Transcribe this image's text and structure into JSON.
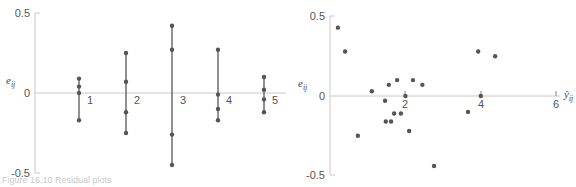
{
  "caption": "Figure 16.10 Residual plots",
  "chart_data": [
    {
      "type": "scatter",
      "title": "",
      "xlabel": "",
      "ylabel": "e_ij",
      "ylim": [
        -0.5,
        0.5
      ],
      "yticks": [
        "0.5",
        "0",
        "-0.5"
      ],
      "grid": false,
      "legend": null,
      "categories": [
        "1",
        "2",
        "3",
        "4",
        "5"
      ],
      "series": [
        {
          "name": "1",
          "values": [
            0.09,
            0.04,
            0.0,
            -0.17
          ]
        },
        {
          "name": "2",
          "values": [
            0.25,
            0.07,
            -0.12,
            -0.25
          ]
        },
        {
          "name": "3",
          "values": [
            0.42,
            0.27,
            -0.26,
            -0.45
          ]
        },
        {
          "name": "4",
          "values": [
            0.27,
            -0.01,
            -0.1,
            -0.17
          ]
        },
        {
          "name": "5",
          "values": [
            0.1,
            0.02,
            -0.04,
            -0.12
          ]
        }
      ],
      "annotations": [
        "vertical lines connect residuals within each group"
      ]
    },
    {
      "type": "scatter",
      "title": "",
      "xlabel": "ŷ_ij",
      "ylabel": "e_ij",
      "xlim": [
        0,
        6.5
      ],
      "ylim": [
        -0.5,
        0.5
      ],
      "xticks": [
        "2",
        "4",
        "6"
      ],
      "yticks": [
        "0.5",
        "0",
        "-0.5"
      ],
      "grid": false,
      "legend": null,
      "x": [
        0.21,
        0.4,
        0.74,
        1.11,
        1.46,
        1.56,
        1.48,
        1.62,
        1.7,
        1.78,
        1.88,
        2.0,
        2.1,
        2.2,
        2.45,
        2.76,
        3.66,
        3.93,
        4.0,
        4.38
      ],
      "y": [
        0.43,
        0.28,
        -0.25,
        0.03,
        -0.03,
        0.07,
        -0.16,
        -0.16,
        -0.11,
        0.1,
        -0.11,
        0.0,
        -0.22,
        0.1,
        0.07,
        -0.44,
        -0.1,
        0.28,
        0.0,
        0.25
      ]
    }
  ],
  "left": {
    "ylabel": "e",
    "ylabel_sub": "ij",
    "yticks": [
      "0.5",
      "0",
      "-0.5"
    ],
    "group_labels": [
      "1",
      "2",
      "3",
      "4",
      "5"
    ]
  },
  "right": {
    "ylabel": "e",
    "ylabel_sub": "ij",
    "xlabel": "ŷ",
    "xlabel_sub": "ij",
    "yticks": [
      "0.5",
      "0",
      "-0.5"
    ],
    "xticks": [
      "2",
      "4",
      "6"
    ]
  },
  "colors": {
    "axis": "#c8c8c8",
    "point": "#555555",
    "line": "#555555",
    "text": "#555555"
  }
}
